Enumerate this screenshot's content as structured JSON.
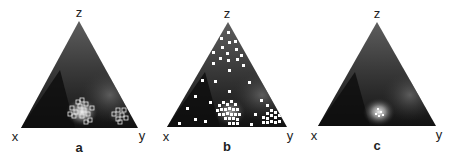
{
  "figure": {
    "panels": [
      {
        "id": "a",
        "caption": "a",
        "vertex_labels": {
          "top": "z",
          "left": "x",
          "right": "y"
        },
        "markers": "hollow-squares",
        "description": "Dark ternary density with bright blob near lower-middle and clusters of hollow square markers near base center and toward y"
      },
      {
        "id": "b",
        "caption": "b",
        "vertex_labels": {
          "top": "z",
          "left": "x",
          "right": "y"
        },
        "markers": "filled-squares",
        "description": "Dark ternary density with scattered white square markers throughout and dense clusters near base center and toward y"
      },
      {
        "id": "c",
        "caption": "c",
        "vertex_labels": {
          "top": "z",
          "left": "x",
          "right": "y"
        },
        "markers": "none",
        "description": "Dark ternary density with single bright glowing spot near base center"
      }
    ],
    "colors": {
      "triangle_dark": "#151515",
      "triangle_mid": "#5a5a5a",
      "marker": "#ffffff",
      "label": "#222222"
    }
  }
}
